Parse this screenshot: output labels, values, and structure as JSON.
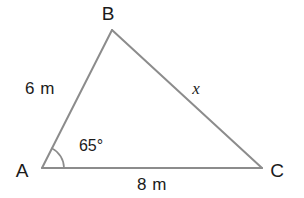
{
  "figure": {
    "type": "triangle-diagram",
    "background_color": "#ffffff",
    "stroke_color": "#8c8c8c",
    "text_color": "#1b1b1b",
    "stroke_width": 2,
    "vertices": [
      {
        "name": "A",
        "label": "A",
        "x": 42,
        "y": 168,
        "label_x": 22,
        "label_y": 170
      },
      {
        "name": "B",
        "label": "B",
        "x": 112,
        "y": 30,
        "label_x": 108,
        "label_y": 13
      },
      {
        "name": "C",
        "label": "C",
        "x": 262,
        "y": 168,
        "label_x": 277,
        "label_y": 170
      }
    ],
    "sides": [
      {
        "name": "side-AB",
        "label": "6 m",
        "value": 6,
        "unit": "m",
        "label_x": 40,
        "label_y": 88
      },
      {
        "name": "side-BC",
        "label": "x",
        "value": null,
        "unit": "",
        "label_x": 196,
        "label_y": 88
      },
      {
        "name": "side-AC",
        "label": "8 m",
        "value": 8,
        "unit": "m",
        "label_x": 152,
        "label_y": 184
      }
    ],
    "angles": [
      {
        "name": "angle-A",
        "label": "65°",
        "value": 65,
        "unit": "degrees",
        "vertex": "A",
        "label_x": 91,
        "label_y": 146,
        "arc_radius": 22
      }
    ]
  }
}
